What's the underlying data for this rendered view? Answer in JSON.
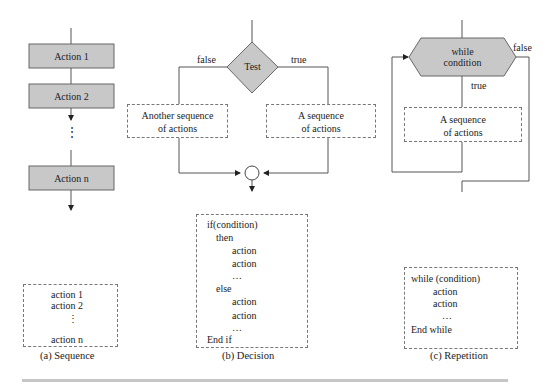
{
  "sequence": {
    "actions": [
      "Action 1",
      "Action 2",
      "Action n"
    ],
    "ellipsis": "⋮",
    "pseudocode": [
      "action 1",
      "action 2",
      "⋮",
      "action n"
    ],
    "caption": "(a) Sequence"
  },
  "decision": {
    "test_label": "Test",
    "false_label": "false",
    "true_label": "true",
    "false_branch": "Another sequence of actions",
    "true_branch": "A sequence of actions",
    "false_branch_lines": [
      "Another sequence",
      "of actions"
    ],
    "true_branch_lines": [
      "A sequence",
      "of actions"
    ],
    "pseudocode": [
      "if(condition)",
      "then",
      "action",
      "action",
      "…",
      "else",
      "action",
      "action",
      "…",
      "End if"
    ],
    "caption": "(b) Decision"
  },
  "repetition": {
    "condition_lines": [
      "while",
      "condition"
    ],
    "false_label": "false",
    "true_label": "true",
    "body_lines": [
      "A sequence",
      "of actions"
    ],
    "pseudocode": [
      "while (condition)",
      "action",
      "action",
      "…",
      "End while"
    ],
    "caption": "(c) Repetition"
  },
  "colors": {
    "shape_fill": "#c8c8c8",
    "line": "#555555",
    "dashed_border": "#777777",
    "rule": "#c6c6c6"
  }
}
